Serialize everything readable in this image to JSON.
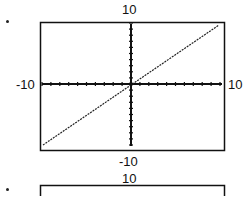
{
  "chart_data": [
    {
      "type": "line",
      "title": "",
      "xlabel": "",
      "ylabel": "",
      "xlim": [
        -10,
        10
      ],
      "ylim": [
        -10,
        10
      ],
      "grid": false,
      "tick_labels": {
        "top": "10",
        "bottom": "-10",
        "left": "-10",
        "right": "10"
      },
      "series": [
        {
          "name": "y = x",
          "x": [
            -10,
            0,
            10
          ],
          "y": [
            -10,
            0,
            10
          ]
        }
      ]
    },
    {
      "type": "line",
      "partial": true,
      "tick_labels": {
        "top": "10"
      }
    }
  ],
  "graph1": {
    "top": "10",
    "bottom": "-10",
    "left": "-10",
    "right": "10"
  },
  "graph2": {
    "top": "10"
  }
}
